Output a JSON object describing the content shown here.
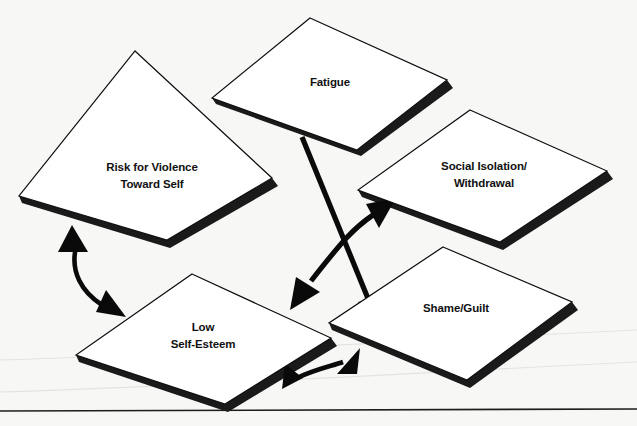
{
  "diagram": {
    "background_color": "#f7f7f6",
    "card_fill": "#ffffff",
    "card_stroke": "#0d0d0d",
    "shadow_color": "#1a1a1a",
    "arrow_color": "#0a0a0a",
    "nodes": [
      {
        "id": "fatigue",
        "label_line1": "Fatigue",
        "label_line2": "",
        "center_x": 330,
        "center_y": 82
      },
      {
        "id": "risk-for-violence",
        "label_line1": "Risk for Violence",
        "label_line2": "Toward Self",
        "center_x": 152,
        "center_y": 175
      },
      {
        "id": "social-isolation",
        "label_line1": "Social Isolation/",
        "label_line2": "Withdrawal",
        "center_x": 484,
        "center_y": 173
      },
      {
        "id": "low-self-esteem",
        "label_line1": "Low",
        "label_line2": "Self-Esteem",
        "center_x": 203,
        "center_y": 335
      },
      {
        "id": "shame-guilt",
        "label_line1": "Shame/Guilt",
        "label_line2": "",
        "center_x": 456,
        "center_y": 308
      }
    ],
    "connectors": [
      {
        "id": "fatigue-to-shame-guilt",
        "from": "fatigue",
        "to": "shame-guilt",
        "style": "straight",
        "heads": "single"
      },
      {
        "id": "low-self-esteem-to-social-isolation",
        "from": "low-self-esteem",
        "to": "social-isolation",
        "style": "curved",
        "heads": "double"
      },
      {
        "id": "risk-for-violence-to-low-self-esteem",
        "from": "risk-for-violence",
        "to": "low-self-esteem",
        "style": "curved",
        "heads": "double"
      },
      {
        "id": "low-self-esteem-to-shame-guilt",
        "from": "low-self-esteem",
        "to": "shame-guilt",
        "style": "curved",
        "heads": "double"
      }
    ]
  },
  "footer": {
    "caption_cutoff": ""
  }
}
